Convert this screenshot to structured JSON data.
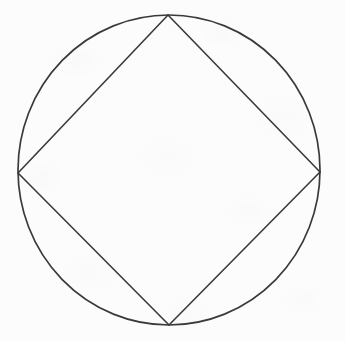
{
  "figure": {
    "background_color": "#fcfcfc",
    "stroke_color": "#3a3a3a",
    "stroke_width": 1.6,
    "canvas": {
      "width": 345,
      "height": 341
    },
    "circle": {
      "name": "circumscribed-circle",
      "center_x": 169,
      "center_y": 170,
      "radius_x": 151,
      "radius_y": 155
    },
    "square": {
      "name": "inscribed-square",
      "orientation": "diamond",
      "vertices": [
        {
          "label": "top",
          "x": 168,
          "y": 15
        },
        {
          "label": "right",
          "x": 320,
          "y": 172
        },
        {
          "label": "bottom",
          "x": 169,
          "y": 325
        },
        {
          "label": "left",
          "x": 18,
          "y": 173
        }
      ],
      "edges": [
        {
          "label": "top-right-edge",
          "from": "top",
          "to": "right"
        },
        {
          "label": "bottom-right-edge",
          "from": "right",
          "to": "bottom"
        },
        {
          "label": "bottom-left-edge",
          "from": "bottom",
          "to": "left"
        },
        {
          "label": "top-left-edge",
          "from": "left",
          "to": "top"
        }
      ]
    }
  }
}
